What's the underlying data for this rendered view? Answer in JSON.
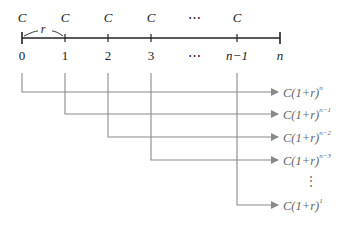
{
  "timeline": {
    "payments": [
      {
        "label": "C",
        "x": 22
      },
      {
        "label": "C",
        "x": 65
      },
      {
        "label": "C",
        "x": 108
      },
      {
        "label": "C",
        "x": 151
      },
      {
        "label": "⋯",
        "x": 194
      },
      {
        "label": "C",
        "x": 237
      }
    ],
    "periods": [
      {
        "label": "0",
        "x": 22
      },
      {
        "label": "1",
        "x": 65
      },
      {
        "label": "2",
        "x": 108
      },
      {
        "label": "3",
        "x": 151
      },
      {
        "label": "⋯",
        "x": 194
      },
      {
        "label": "n−1",
        "x": 237
      },
      {
        "label": "n",
        "x": 280
      }
    ],
    "rate_label": "r"
  },
  "results": [
    {
      "base": "C(1+r)",
      "exp": "n",
      "y": 92
    },
    {
      "base": "C(1+r)",
      "exp": "n−1",
      "y": 114
    },
    {
      "base": "C(1+r)",
      "exp": "n−2",
      "y": 137
    },
    {
      "base": "C(1+r)",
      "exp": "n−3",
      "y": 160
    },
    {
      "base": "C(1+r)",
      "exp": "1",
      "y": 205
    }
  ],
  "vdots": "⋮",
  "colors": {
    "timeline": "#222222",
    "connector": "#8a8a8a",
    "result_text": "#666666"
  }
}
